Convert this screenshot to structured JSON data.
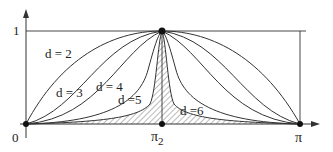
{
  "diagram": {
    "axes": {
      "y_tick_label": "1",
      "origin_label": "0",
      "x_mid_label": "π",
      "x_mid_sub": "2",
      "x_end_label": "π"
    },
    "curves": [
      {
        "label": "d = 2"
      },
      {
        "label": "d = 3"
      },
      {
        "label": "d = 4"
      },
      {
        "label": "d =5"
      },
      {
        "label": "d =6"
      }
    ],
    "colors": {
      "line": "#333333",
      "hatch": "#555555",
      "background": "#ffffff"
    }
  }
}
